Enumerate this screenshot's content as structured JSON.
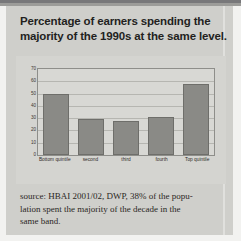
{
  "title": {
    "line1": "Percentage of earners spending the",
    "line2": "majority of the 1990s at the same level."
  },
  "chart_data": {
    "type": "bar",
    "title": "Percentage of earners spending the majority of the 1990s at the same level.",
    "categories": [
      "Bottom quintile",
      "second",
      "third",
      "fourth",
      "Top quintile"
    ],
    "values": [
      50,
      29,
      28,
      31,
      58
    ],
    "xlabel": "",
    "ylabel": "",
    "ylim": [
      0,
      70
    ],
    "yticks": [
      70,
      60,
      50,
      40,
      30,
      20,
      10,
      0
    ],
    "grid": true,
    "legend": "none",
    "bar_color": "#8a8a86",
    "plot_background": "#d8d8d4"
  },
  "source": {
    "line1": "source: HBAI 2001/02, DWP, 38% of the popu-",
    "line2": "lation spent the majority of the decade in the",
    "line3": "same band."
  },
  "colors": {
    "paper": "#cfcfcb",
    "figure": "#d4d4d0",
    "ink": "#231f1e",
    "frame": "#8e8e8a"
  }
}
